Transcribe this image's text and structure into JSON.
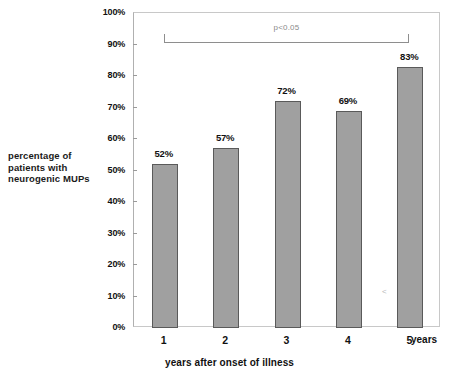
{
  "chart_data": {
    "type": "bar",
    "title": "",
    "subtitle": "",
    "categories": [
      "1",
      "2",
      "3",
      "4",
      "5"
    ],
    "values": [
      52,
      57,
      72,
      69,
      83
    ],
    "value_labels": [
      "52%",
      "57%",
      "72%",
      "69%",
      "83%"
    ],
    "xlabel": "years after onset of illness",
    "x_unit_suffix": "years",
    "ylabel": "percentage of patients with neurogenic MUPs",
    "ylabel_lines": [
      "percentage of",
      "patients with",
      "neurogenic MUPs"
    ],
    "ylim": [
      0,
      100
    ],
    "ytick_values": [
      0,
      10,
      20,
      30,
      40,
      50,
      60,
      70,
      80,
      90,
      100
    ],
    "ytick_labels": [
      "0%",
      "10%",
      "20%",
      "30%",
      "40%",
      "50%",
      "60%",
      "70%",
      "80%",
      "90%",
      "100%"
    ],
    "grid": false,
    "legend": false,
    "legend_position": "none",
    "bar_color": "#a0a0a0",
    "bar_border_color": "#5a5a5a",
    "frame_color": "#c8c8c8",
    "text_color": "#111111",
    "annotations": [
      {
        "type": "significance-bracket",
        "label": "p<0.05",
        "from_category": "1",
        "to_category": "5",
        "y": 93,
        "color": "#8a8a8a"
      },
      {
        "type": "scan-artifact",
        "label": "<",
        "color": "#b9b9b9"
      }
    ]
  }
}
